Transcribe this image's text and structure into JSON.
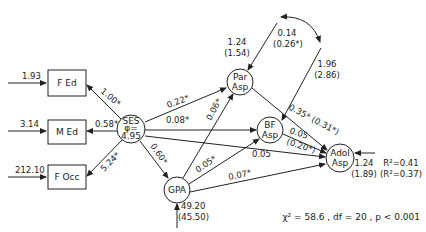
{
  "diagram": {
    "type": "path-diagram",
    "nodes": {
      "fed": {
        "label": "F Ed",
        "shape": "box",
        "error": "1.93"
      },
      "med": {
        "label": "M Ed",
        "shape": "box",
        "error": "3.14"
      },
      "focc": {
        "label": "F Occ",
        "shape": "box",
        "error": "212.10"
      },
      "ses": {
        "label_line1": "SES",
        "label_line2": "φ=",
        "label_line3": "4.95",
        "shape": "circle"
      },
      "par": {
        "label_line1": "Par",
        "label_line2": "Asp",
        "shape": "circle",
        "error_line1": "1.24",
        "error_line2": "(1.54)"
      },
      "bf": {
        "label_line1": "BF",
        "label_line2": "Asp",
        "shape": "circle"
      },
      "gpa": {
        "label": "GPA",
        "shape": "circle",
        "error_line1": "49.20",
        "error_line2": "(45.50)"
      },
      "adol": {
        "label_line1": "Adol",
        "label_line2": "Asp",
        "shape": "circle",
        "error_line1": "1.24",
        "error_line2": "(1.89)",
        "r2_line1": "R²=0.41",
        "r2_line2": "(R²=0.37)"
      }
    },
    "paths": {
      "ses_fed": "1.00*",
      "ses_med": "0.58*",
      "ses_focc": "5.24*",
      "ses_par": "0.22*",
      "ses_bf": "0.08*",
      "ses_adol": "0.05",
      "ses_gpa": "0.60*",
      "gpa_par": "0.06*",
      "gpa_bf": "0.05*",
      "gpa_adol": "0.07*",
      "par_adol": "0.35* (0.31*)",
      "bf_adol_line1": "0.05",
      "bf_adol_line2": "(0.20*)"
    },
    "covariance": {
      "label_line1": "0.14",
      "label_line2": "(0.26*)",
      "bf_error_line1": "1.96",
      "bf_error_line2": "(2.86)"
    },
    "fit": "χ² = 58.6 , df = 20 , p < 0.001"
  }
}
